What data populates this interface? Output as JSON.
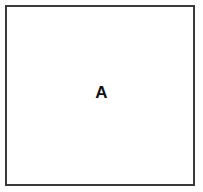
{
  "figure": {
    "type": "region-diagram",
    "background_color": "#ffffff",
    "box": {
      "label": "A",
      "border_color": "#3a3a3a",
      "border_width_px": 2,
      "fill_color": "#ffffff"
    }
  }
}
